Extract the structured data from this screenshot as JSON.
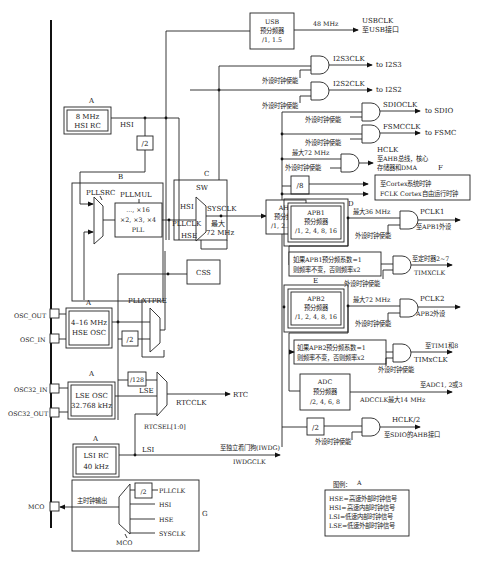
{
  "diagram": {
    "section_labels": {
      "A1": "A",
      "A2": "A",
      "A3": "A",
      "A4": "A",
      "B": "B",
      "C": "C",
      "D": "D",
      "E": "E",
      "F": "F",
      "G": "G"
    },
    "sources": {
      "hsi_rc": {
        "line1": "8 MHz",
        "line2": "HSI RC"
      },
      "hse_osc": {
        "line1": "4–16 MHz",
        "line2": "HSE OSC"
      },
      "lse_osc": {
        "line1": "LSE OSC",
        "line2": "32.768 kHz"
      },
      "lsi_rc": {
        "line1": "LSI RC",
        "line2": "40 kHz"
      }
    },
    "pins": {
      "osc_out": "OSC_OUT",
      "osc_in": "OSC_IN",
      "osc32_in": "OSC32_IN",
      "osc32_out": "OSC32_OUT",
      "mco": "MCO"
    },
    "signals": {
      "hsi": "HSI",
      "hse": "HSE",
      "lse": "LSE",
      "lsi": "LSI",
      "pllclk": "PLLCLK",
      "sysclk": "SYSCLK",
      "rtcclk": "RTCCLK",
      "rtc": "RTC",
      "iwdg_to": "至独立看门狗(IWDG)",
      "iwdgclk": "IWDGCLK"
    },
    "blocks": {
      "usb": {
        "line1": "USB",
        "line2": "预分频器",
        "line3": "/1, 1.5",
        "freq": "48 MHz",
        "out1": "USBCLK",
        "out2": "至USB接口"
      },
      "div2_hsi": "/2",
      "div2_hse": "/2",
      "div128": "/128",
      "div8": "/8",
      "div2_hclk": "/2",
      "pll": {
        "mul_label": "PLLMUL",
        "line1": "..., ×16",
        "line2": "×2, ×3, ×4",
        "line3": "PLL"
      },
      "pllsrc": "PLLSRC",
      "pllxtpre": "PLLXTPRE",
      "sw": "SW",
      "sys_max": {
        "line1": "最大",
        "line2": "72 MHz"
      },
      "css": "CSS",
      "rtcsel": "RTCSEL[1:0]",
      "ahb": {
        "line1": "AHB",
        "line2": "预分频器",
        "line3": "/1, 2..512"
      },
      "apb1": {
        "line1": "APB1",
        "line2": "预分频器",
        "line3": "/1, 2, 4, 8, 16"
      },
      "apb2": {
        "line1": "APB2",
        "line2": "预分频器",
        "line3": "/1, 2, 4, 8, 16"
      },
      "tim1_mult": {
        "line1": "如果APB1预分频系数=1",
        "line2": "则频率不变，否则频率x2"
      },
      "tim2_mult": {
        "line1": "如果APB2预分频系数=1",
        "line2": "则频率不变，否则频率x2"
      },
      "adc": {
        "line1": "ADC",
        "line2": "预分频器",
        "line3": "/2, 4, 6, 8"
      }
    },
    "outputs": {
      "i2s3": {
        "clk": "I2S3CLK",
        "to": "to I2S3"
      },
      "i2s2": {
        "clk": "I2S2CLK",
        "to": "to I2S2"
      },
      "sdio": {
        "clk": "SDIOCLK",
        "to": "to SDIO"
      },
      "fsmc": {
        "clk": "FSMCCLK",
        "to": "to FSMC"
      },
      "hclk": {
        "max": "最大72 MHz",
        "l1": "HCLK",
        "l2": "至AHB总线，核心",
        "l3": "存储器和DMA"
      },
      "cortex": {
        "l1": "至Cortex系统时钟",
        "l2": "FCLK Cortex自由运行时钟"
      },
      "pclk1": {
        "max": "最大36 MHz",
        "l1": "PCLK1",
        "l2": "至APB1外设"
      },
      "timx1": {
        "l1": "至定时器2~7",
        "l2": "TIMXCLK"
      },
      "pclk2": {
        "max": "最大72 MHz",
        "l1": "PCLK2",
        "l2": "APB2外设"
      },
      "timx2": {
        "l1": "至TIM1和8",
        "l2": "TIMxCLK"
      },
      "adcclk": {
        "l1": "至ADC1, 2或3",
        "l2": "ADCCLK最大14 MHz"
      },
      "hclk2": {
        "l1": "HCLK/2",
        "l2": "至SDIO的AHB接口"
      }
    },
    "enable_label": "外设时钟使能",
    "mco_section": {
      "main_out": "主时钟输出",
      "div2": "/2",
      "inputs": [
        "PLLCLK",
        "HSI",
        "HSE",
        "SYSCLK"
      ],
      "mux": "MCO"
    },
    "legend": {
      "title": "图例：",
      "title_tag": "A",
      "items": [
        "HSE=高速外部时钟信号",
        "HSI=高速内部时钟信号",
        "LSI=低速内部时钟信号",
        "LSE=低速外部时钟信号"
      ]
    }
  }
}
